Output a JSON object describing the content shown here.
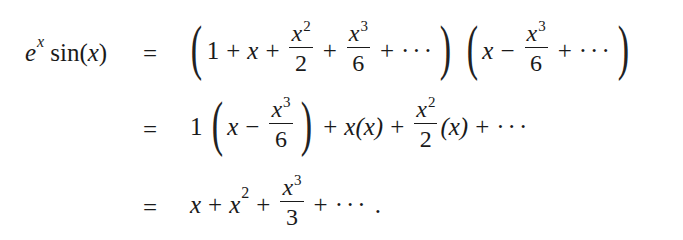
{
  "equation": {
    "lhs": {
      "base": "e",
      "exp": "x",
      "func": "sin",
      "arg_open": "(",
      "arg": "x",
      "arg_close": ")"
    },
    "rows": [
      {
        "rel": "=",
        "terms": {
          "one": "1",
          "plus": "+",
          "x": "x",
          "f1_num": "x",
          "f1_exp": "2",
          "f1_den": "2",
          "f2_num": "x",
          "f2_exp": "3",
          "f2_den": "6",
          "dots": "···",
          "g_x": "x",
          "minus": "−",
          "g1_num": "x",
          "g1_exp": "3",
          "g1_den": "6"
        }
      },
      {
        "rel": "=",
        "terms": {
          "coef": "1",
          "x": "x",
          "minus": "−",
          "f_num": "x",
          "f_exp": "3",
          "f_den": "6",
          "plus": "+",
          "xx": "x(x)",
          "h_num": "x",
          "h_exp": "2",
          "h_den": "2",
          "h_tail": "(x)",
          "dots": "···"
        }
      },
      {
        "rel": "=",
        "terms": {
          "x": "x",
          "plus": "+",
          "x2_base": "x",
          "x2_exp": "2",
          "f_num": "x",
          "f_exp": "3",
          "f_den": "3",
          "dots": "···",
          "period": "."
        }
      }
    ]
  }
}
